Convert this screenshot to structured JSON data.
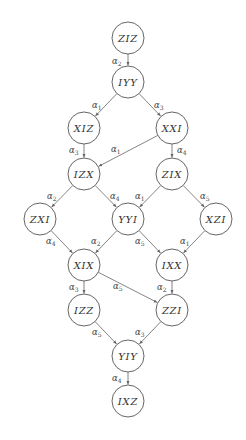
{
  "diagram": {
    "type": "directed-graph",
    "node_radius": 16,
    "colors": {
      "stroke": "#555555",
      "edge": "#666666",
      "text": "#333333",
      "background": "#ffffff"
    },
    "nodes": [
      {
        "id": "ZIZ",
        "label": "ZIZ",
        "x": 128,
        "y": 38
      },
      {
        "id": "IYY",
        "label": "IYY",
        "x": 128,
        "y": 82
      },
      {
        "id": "XIZ",
        "label": "XIZ",
        "x": 84,
        "y": 128
      },
      {
        "id": "XXI",
        "label": "XXI",
        "x": 172,
        "y": 128
      },
      {
        "id": "IZX",
        "label": "IZX",
        "x": 84,
        "y": 174
      },
      {
        "id": "ZIX",
        "label": "ZIX",
        "x": 172,
        "y": 174
      },
      {
        "id": "ZXI",
        "label": "ZXI",
        "x": 40,
        "y": 219
      },
      {
        "id": "YYI",
        "label": "YYI",
        "x": 128,
        "y": 219
      },
      {
        "id": "XZI",
        "label": "XZI",
        "x": 216,
        "y": 219
      },
      {
        "id": "XIX",
        "label": "XIX",
        "x": 84,
        "y": 265
      },
      {
        "id": "IXX",
        "label": "IXX",
        "x": 172,
        "y": 265
      },
      {
        "id": "IZZ",
        "label": "IZZ",
        "x": 84,
        "y": 310
      },
      {
        "id": "ZZI",
        "label": "ZZI",
        "x": 172,
        "y": 310
      },
      {
        "id": "YIY",
        "label": "YIY",
        "x": 128,
        "y": 356
      },
      {
        "id": "IXZ",
        "label": "IXZ",
        "x": 128,
        "y": 401
      }
    ],
    "edges": [
      {
        "from": "ZIZ",
        "to": "IYY",
        "label": "α",
        "sub": "2",
        "lx": 112,
        "ly": 64
      },
      {
        "from": "IYY",
        "to": "XIZ",
        "label": "α",
        "sub": "1",
        "lx": 92,
        "ly": 108
      },
      {
        "from": "IYY",
        "to": "XXI",
        "label": "α",
        "sub": "3",
        "lx": 154,
        "ly": 108
      },
      {
        "from": "XIZ",
        "to": "IZX",
        "label": "α",
        "sub": "3",
        "lx": 69,
        "ly": 153
      },
      {
        "from": "XXI",
        "to": "IZX",
        "label": "α",
        "sub": "1",
        "lx": 111,
        "ly": 152
      },
      {
        "from": "XXI",
        "to": "ZIX",
        "label": "α",
        "sub": "4",
        "lx": 177,
        "ly": 153
      },
      {
        "from": "IZX",
        "to": "ZXI",
        "label": "α",
        "sub": "2",
        "lx": 47,
        "ly": 199
      },
      {
        "from": "IZX",
        "to": "YYI",
        "label": "α",
        "sub": "4",
        "lx": 110,
        "ly": 199
      },
      {
        "from": "ZIX",
        "to": "YYI",
        "label": "α",
        "sub": "1",
        "lx": 135,
        "ly": 199
      },
      {
        "from": "ZIX",
        "to": "XZI",
        "label": "α",
        "sub": "5",
        "lx": 200,
        "ly": 199
      },
      {
        "from": "ZXI",
        "to": "XIX",
        "label": "α",
        "sub": "4",
        "lx": 46,
        "ly": 244
      },
      {
        "from": "YYI",
        "to": "XIX",
        "label": "α",
        "sub": "2",
        "lx": 91,
        "ly": 244
      },
      {
        "from": "YYI",
        "to": "IXX",
        "label": "α",
        "sub": "5",
        "lx": 135,
        "ly": 244
      },
      {
        "from": "XZI",
        "to": "IXX",
        "label": "α",
        "sub": "1",
        "lx": 180,
        "ly": 244
      },
      {
        "from": "XIX",
        "to": "IZZ",
        "label": "α",
        "sub": "3",
        "lx": 69,
        "ly": 290
      },
      {
        "from": "XIX",
        "to": "ZZI",
        "label": "α",
        "sub": "5",
        "lx": 113,
        "ly": 289
      },
      {
        "from": "IXX",
        "to": "ZZI",
        "label": "α",
        "sub": "2",
        "lx": 157,
        "ly": 290
      },
      {
        "from": "IZZ",
        "to": "YIY",
        "label": "α",
        "sub": "5",
        "lx": 92,
        "ly": 335
      },
      {
        "from": "ZZI",
        "to": "YIY",
        "label": "α",
        "sub": "3",
        "lx": 135,
        "ly": 335
      },
      {
        "from": "YIY",
        "to": "IXZ",
        "label": "α",
        "sub": "4",
        "lx": 112,
        "ly": 381
      }
    ]
  }
}
